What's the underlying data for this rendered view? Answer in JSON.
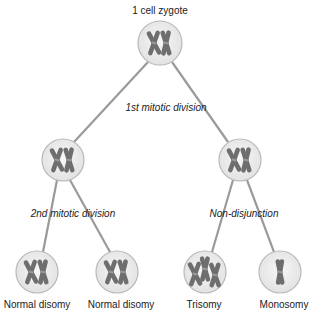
{
  "title": "1 cell zygote",
  "colors": {
    "line": "#9a9a9a",
    "cell_fill": "#ececec",
    "cell_stroke": "#b8b8b8",
    "chromosome": "#6e6e6e",
    "text": "#222222"
  },
  "division_labels": {
    "first": "1st mitotic division",
    "second": "2nd mitotic division",
    "nondisjunction": "Non-disjunction"
  },
  "cells": {
    "zygote": {
      "label": "1 cell zygote",
      "chromosomes": 2
    },
    "mid_left": {
      "label": "",
      "chromosomes": 2
    },
    "mid_right": {
      "label": "",
      "chromosomes": 2
    },
    "bottom_1": {
      "label": "Normal disomy",
      "chromosomes": 2
    },
    "bottom_2": {
      "label": "Normal disomy",
      "chromosomes": 2
    },
    "bottom_3": {
      "label": "Trisomy",
      "chromosomes": 3
    },
    "bottom_4": {
      "label": "Monosomy",
      "chromosomes": 1
    }
  }
}
